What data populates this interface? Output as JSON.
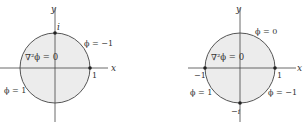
{
  "diagrams": [
    {
      "axis_x_label": "x",
      "axis_y_label": "y",
      "equation": "∇²ϕ = 0",
      "point_top": "i",
      "point_right": "1",
      "boundary_upper": "ϕ = −1",
      "boundary_lower": "ϕ = 1"
    },
    {
      "axis_x_label": "x",
      "axis_y_label": "y",
      "equation": "∇²ϕ = 0",
      "point_left": "−1",
      "point_right": "1",
      "point_bottom": "−i",
      "boundary_upper": "ϕ = 0",
      "boundary_lower_left": "ϕ = 1",
      "boundary_lower_right": "ϕ = −1"
    }
  ],
  "colors": {
    "disk_fill": "#ececec",
    "stroke": "#444444"
  }
}
